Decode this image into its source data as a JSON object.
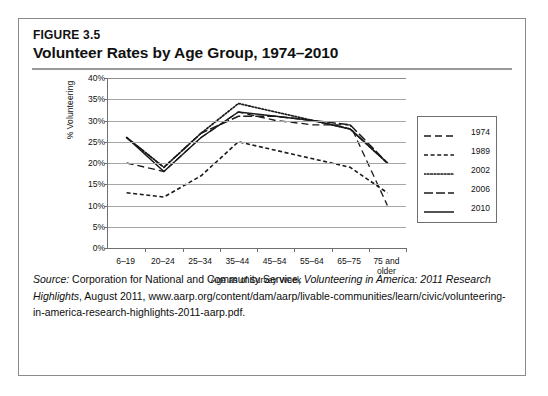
{
  "figure": {
    "number": "FIGURE 3.5",
    "title": "Volunteer Rates by Age Group, 1974–2010"
  },
  "chart_data": {
    "type": "line",
    "title": "Volunteer Rates by Age Group, 1974–2010",
    "xlabel": "Age as of Survey Week",
    "ylabel": "% Volunteering",
    "categories": [
      "6–19",
      "20–24",
      "25–34",
      "35–44",
      "45–54",
      "55–64",
      "65–75",
      "75 and older"
    ],
    "ylim": [
      0,
      40
    ],
    "ytick_labels": [
      "0%",
      "5%",
      "10%",
      "15%",
      "20%",
      "25%",
      "30%",
      "35%",
      "40%"
    ],
    "ytick_values": [
      0,
      5,
      10,
      15,
      20,
      25,
      30,
      35,
      40
    ],
    "grid": true,
    "legend_position": "right",
    "series": [
      {
        "name": "1974",
        "dash": "long-dash",
        "values": [
          20,
          18,
          26,
          32,
          30,
          29,
          29,
          10
        ]
      },
      {
        "name": "1989",
        "dash": "dash-dot",
        "values": [
          13,
          12,
          17,
          25,
          23,
          21,
          19,
          13
        ]
      },
      {
        "name": "2002",
        "dash": "dotted",
        "values": [
          26,
          19,
          27,
          34,
          32,
          30,
          28,
          20
        ]
      },
      {
        "name": "2006",
        "dash": "dashed",
        "values": [
          26,
          19,
          27,
          31,
          31,
          30,
          29,
          20
        ]
      },
      {
        "name": "2010",
        "dash": "solid",
        "values": [
          26,
          18,
          26,
          32,
          31,
          30,
          28,
          20
        ]
      }
    ]
  },
  "source": {
    "label": "Source:",
    "line1_rest": " Corporation for National and Community Service, ",
    "italic1": "Volunteering in America: 2011 Research Highlights",
    "line2_rest": ", August 2011, www.aarp.org/content/dam/",
    "line3": "aarp/livable-communities/learn/civic/volunteering-in-america-research-",
    "line4": "highlights-2011-aarp.pdf."
  },
  "colors": {
    "line": "#1a1a1a",
    "grid": "#a6a6a6",
    "axis": "#6f6f6f",
    "border": "#8a8a8a",
    "rule": "#9a9a9a"
  }
}
